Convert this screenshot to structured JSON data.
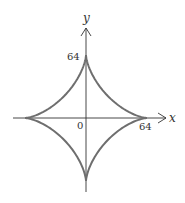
{
  "chart_data": {
    "type": "line",
    "title": "",
    "curve": "astroid x^(2/3) + y^(2/3) = 64^(2/3)",
    "parametric": {
      "x": "64*cos(t)^3",
      "y": "64*sin(t)^3",
      "t_range": [
        0,
        6.283185
      ]
    },
    "xlabel": "x",
    "ylabel": "y",
    "xlim": [
      -80,
      100
    ],
    "ylim": [
      -75,
      95
    ],
    "grid": false,
    "legend": null,
    "annotations": [
      {
        "text": "64",
        "at": "y-axis top intercept"
      },
      {
        "text": "0",
        "at": "origin"
      },
      {
        "text": "64",
        "at": "x-axis right intercept"
      }
    ],
    "key_points": [
      {
        "x": 64,
        "y": 0
      },
      {
        "x": 0,
        "y": 64
      },
      {
        "x": -64,
        "y": 0
      },
      {
        "x": 0,
        "y": -64
      }
    ]
  },
  "labels": {
    "x_axis": "x",
    "y_axis": "y",
    "y_intercept": "64",
    "origin": "0",
    "x_intercept": "64"
  },
  "colors": {
    "curve": "#6e6e6e",
    "axes": "#333333",
    "text": "#333333"
  }
}
